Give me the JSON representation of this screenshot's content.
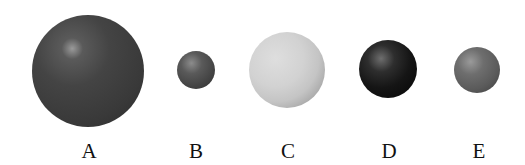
{
  "figure": {
    "spheres": [
      {
        "label": "A",
        "shade": "dark gray",
        "size": "large",
        "cx": 88,
        "cy": 71,
        "r": 56,
        "highlight": "#8a8a8a",
        "base": "#404040",
        "edge": "#2a2a2a"
      },
      {
        "label": "B",
        "shade": "dark gray",
        "size": "small",
        "cx": 196,
        "cy": 70,
        "r": 19,
        "highlight": "#8c8c8c",
        "base": "#4a4a4a",
        "edge": "#2e2e2e"
      },
      {
        "label": "C",
        "shade": "light gray",
        "size": "medium-large",
        "cx": 287,
        "cy": 70,
        "r": 38,
        "highlight": "#e0e0e0",
        "base": "#cfcfcf",
        "edge": "#8e8e8e"
      },
      {
        "label": "D",
        "shade": "black",
        "size": "medium",
        "cx": 388,
        "cy": 69,
        "r": 29,
        "highlight": "#6a6a6a",
        "base": "#151515",
        "edge": "#050505"
      },
      {
        "label": "E",
        "shade": "medium gray",
        "size": "small-medium",
        "cx": 477,
        "cy": 70,
        "r": 23,
        "highlight": "#9a9a9a",
        "base": "#5e5e5e",
        "edge": "#3c3c3c"
      }
    ]
  }
}
